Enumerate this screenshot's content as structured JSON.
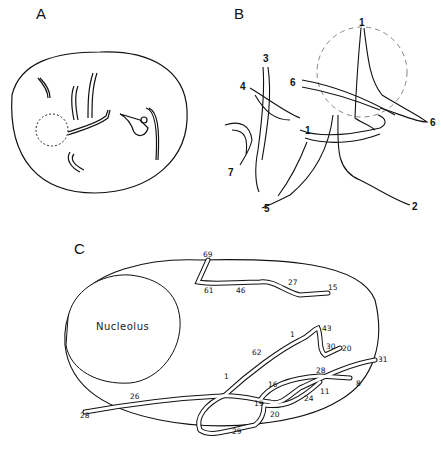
{
  "panels": {
    "a": {
      "label": "A"
    },
    "b": {
      "label": "B",
      "chromosome_labels": [
        "1",
        "1",
        "2",
        "3",
        "4",
        "5",
        "6",
        "6",
        "7"
      ]
    },
    "c": {
      "label": "C",
      "nucleolus_label": "Nucleolus",
      "segment_labels": {
        "top_strand": [
          "69",
          "61",
          "46",
          "27",
          "15"
        ],
        "loop_strand": [
          "1",
          "62",
          "1",
          "43",
          "30",
          "20"
        ],
        "right_strand": [
          "28",
          "31",
          "11",
          "8",
          "16",
          "24"
        ],
        "bottom_strand": [
          "28",
          "26",
          "19",
          "20",
          "29"
        ]
      }
    }
  }
}
